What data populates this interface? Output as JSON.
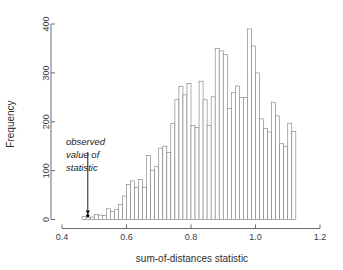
{
  "chart_data": {
    "type": "bar",
    "title": "",
    "subtitle": "",
    "xlabel": "sum-of-distances statistic",
    "ylabel": "Frequency",
    "xlim": [
      0.4,
      1.2
    ],
    "ylim": [
      0,
      440
    ],
    "xticks": [
      0.4,
      0.6,
      0.8,
      1.0,
      1.2
    ],
    "xtick_labels": [
      "0.4",
      "0.6",
      "0.8",
      "1.0",
      "1.2"
    ],
    "yticks": [
      0,
      100,
      200,
      300,
      400
    ],
    "ytick_labels": [
      "0",
      "100",
      "200",
      "300",
      "400"
    ],
    "grid": false,
    "legend": "none",
    "bin_width": 0.0125,
    "bin_starts": [
      0.4625,
      0.475,
      0.4875,
      0.5,
      0.5125,
      0.525,
      0.5375,
      0.55,
      0.5625,
      0.575,
      0.5875,
      0.6,
      0.6125,
      0.625,
      0.6375,
      0.65,
      0.6625,
      0.675,
      0.6875,
      0.7,
      0.7125,
      0.725,
      0.7375,
      0.75,
      0.7625,
      0.775,
      0.7875,
      0.8,
      0.8125,
      0.825,
      0.8375,
      0.85,
      0.8625,
      0.875,
      0.8875,
      0.9,
      0.9125,
      0.925,
      0.9375,
      0.95,
      0.9625,
      0.975,
      0.9875,
      1.0,
      1.0125,
      1.025,
      1.0375,
      1.05,
      1.0625,
      1.075,
      1.0875,
      1.1,
      1.1125
    ],
    "values": [
      6,
      4,
      5,
      10,
      9,
      8,
      22,
      17,
      20,
      31,
      48,
      72,
      79,
      66,
      82,
      66,
      131,
      101,
      108,
      146,
      150,
      137,
      196,
      245,
      272,
      255,
      278,
      192,
      188,
      283,
      245,
      192,
      251,
      350,
      345,
      338,
      227,
      260,
      273,
      250,
      250,
      390,
      355,
      300,
      206,
      186,
      179,
      240,
      212,
      155,
      150,
      197,
      180,
      158,
      169,
      140,
      101,
      92,
      57,
      44,
      30,
      12,
      5
    ],
    "annotation": {
      "text_lines": [
        "observed",
        "value of",
        "statistic"
      ],
      "target_x": 0.48,
      "target_y": 8
    }
  }
}
